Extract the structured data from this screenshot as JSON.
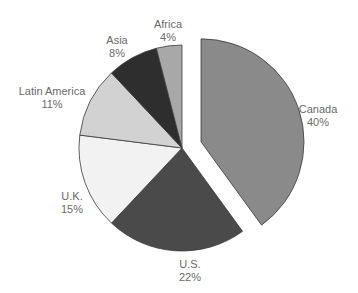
{
  "chart_data": {
    "type": "pie",
    "title": "",
    "categories": [
      "Canada",
      "U.S.",
      "U.K.",
      "Latin America",
      "Asia",
      "Africa"
    ],
    "values": [
      40,
      22,
      15,
      11,
      8,
      4
    ],
    "unit": "%",
    "exploded": [
      "Canada"
    ],
    "colors": [
      "#8a8a8a",
      "#4a4a4a",
      "#f2f2f2",
      "#d2d2d2",
      "#2e2e2e",
      "#a8a8a8"
    ],
    "labels": [
      {
        "name": "Canada",
        "pct": "40%",
        "x": 318,
        "y": 103
      },
      {
        "name": "U.S.",
        "pct": "22%",
        "x": 190,
        "y": 258
      },
      {
        "name": "U.K.",
        "pct": "15%",
        "x": 72,
        "y": 190
      },
      {
        "name": "Latin America",
        "pct": "11%",
        "x": 52,
        "y": 85
      },
      {
        "name": "Asia",
        "pct": "8%",
        "x": 117,
        "y": 34
      },
      {
        "name": "Africa",
        "pct": "4%",
        "x": 168,
        "y": 18
      }
    ]
  }
}
